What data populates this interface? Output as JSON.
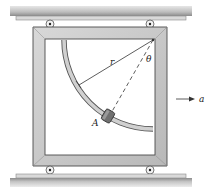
{
  "diagram": {
    "type": "mechanics-figure",
    "labels": {
      "radius": "r",
      "angle": "θ",
      "collar": "A",
      "acceleration": "a"
    },
    "colors": {
      "frame": "#c9c9c9",
      "frame_edge": "#4a4a4a",
      "rail_dark": "#9a9a9a",
      "rail_light": "#d6d6d6",
      "rod": "#bdbdbd",
      "collar": "#6e6e6e",
      "line": "#333333"
    }
  }
}
